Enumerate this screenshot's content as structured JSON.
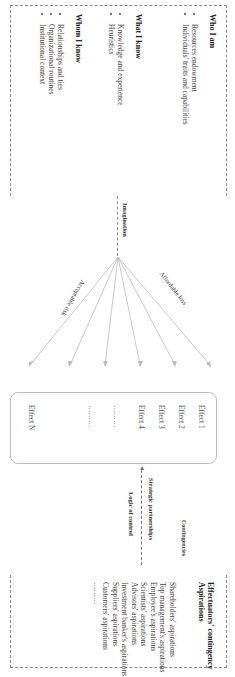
{
  "left": {
    "who_i_am": {
      "title": "Who I am",
      "items": [
        "Resources endowment",
        "Individuals' traits and capabilities"
      ]
    },
    "what_i_know": {
      "title": "What I know",
      "items": [
        "Knowledge and experience",
        "Heuristics"
      ]
    },
    "whom_i_know": {
      "title": "Whom I know",
      "items": [
        "Relationships and ties",
        "Organizational routines",
        "Institutional context"
      ]
    }
  },
  "middle": {
    "imagination": "Imagination",
    "affordable_loss": "Affordable loss",
    "acceptable_risk": "Acceptable risk",
    "effects": [
      "Effect 1",
      "Effect 2",
      "Effect 3",
      "Effect 4",
      "………",
      "………",
      "Effect N"
    ]
  },
  "right": {
    "strategic_partnerships": "Strategic partnerships",
    "logic_of_control": "Logic of control",
    "contingencies": "Contingencies",
    "aspirations_title": "Effectuators' contingency",
    "aspirations_subtitle": "Aspirations",
    "aspirations": [
      "Shareholders' aspirations",
      "Top management's aspirations",
      "Employee's aspirations",
      "Scientists' aspirations",
      "Advisors' aspirations",
      "Investment banker's aspirations",
      "Suppliers' aspirations",
      "Customers' aspirations",
      "………"
    ]
  }
}
